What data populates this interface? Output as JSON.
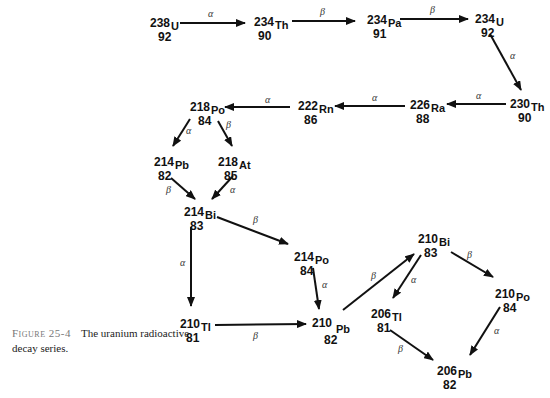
{
  "caption": {
    "figure_label": "Figure 25-4",
    "text": "The uranium radioactive decay series."
  },
  "nuclides": [
    {
      "id": "U238",
      "mass": "238",
      "symbol": "U",
      "z": "92"
    },
    {
      "id": "Th234",
      "mass": "234",
      "symbol": "Th",
      "z": "90"
    },
    {
      "id": "Pa234",
      "mass": "234",
      "symbol": "Pa",
      "z": "91"
    },
    {
      "id": "U234",
      "mass": "234",
      "symbol": "U",
      "z": "92"
    },
    {
      "id": "Th230",
      "mass": "230",
      "symbol": "Th",
      "z": "90"
    },
    {
      "id": "Ra226",
      "mass": "226",
      "symbol": "Ra",
      "z": "88"
    },
    {
      "id": "Rn222",
      "mass": "222",
      "symbol": "Rn",
      "z": "86"
    },
    {
      "id": "Po218",
      "mass": "218",
      "symbol": "Po",
      "z": "84"
    },
    {
      "id": "Pb214",
      "mass": "214",
      "symbol": "Pb",
      "z": "82"
    },
    {
      "id": "At218",
      "mass": "218",
      "symbol": "At",
      "z": "85"
    },
    {
      "id": "Bi214",
      "mass": "214",
      "symbol": "Bi",
      "z": "83"
    },
    {
      "id": "Po214",
      "mass": "214",
      "symbol": "Po",
      "z": "84"
    },
    {
      "id": "Tl210",
      "mass": "210",
      "symbol": "Tl",
      "z": "81"
    },
    {
      "id": "Pb210",
      "mass": "210",
      "symbol": "Pb",
      "z": "82"
    },
    {
      "id": "Bi210",
      "mass": "210",
      "symbol": "Bi",
      "z": "83"
    },
    {
      "id": "Tl206",
      "mass": "206",
      "symbol": "Tl",
      "z": "81"
    },
    {
      "id": "Po210",
      "mass": "210",
      "symbol": "Po",
      "z": "84"
    },
    {
      "id": "Pb206",
      "mass": "206",
      "symbol": "Pb",
      "z": "82"
    }
  ],
  "decays": [
    {
      "from": "U238",
      "to": "Th234",
      "type": "α"
    },
    {
      "from": "Th234",
      "to": "Pa234",
      "type": "β"
    },
    {
      "from": "Pa234",
      "to": "U234",
      "type": "β"
    },
    {
      "from": "U234",
      "to": "Th230",
      "type": "α"
    },
    {
      "from": "Th230",
      "to": "Ra226",
      "type": "α"
    },
    {
      "from": "Ra226",
      "to": "Rn222",
      "type": "α"
    },
    {
      "from": "Rn222",
      "to": "Po218",
      "type": "α"
    },
    {
      "from": "Po218",
      "to": "Pb214",
      "type": "α"
    },
    {
      "from": "Po218",
      "to": "At218",
      "type": "β"
    },
    {
      "from": "Pb214",
      "to": "Bi214",
      "type": "β"
    },
    {
      "from": "At218",
      "to": "Bi214",
      "type": "α"
    },
    {
      "from": "Bi214",
      "to": "Po214",
      "type": "β"
    },
    {
      "from": "Bi214",
      "to": "Tl210",
      "type": "α"
    },
    {
      "from": "Po214",
      "to": "Pb210",
      "type": "α"
    },
    {
      "from": "Tl210",
      "to": "Pb210",
      "type": "β"
    },
    {
      "from": "Pb210",
      "to": "Bi210",
      "type": "β"
    },
    {
      "from": "Bi210",
      "to": "Tl206",
      "type": "α"
    },
    {
      "from": "Bi210",
      "to": "Po210",
      "type": "β"
    },
    {
      "from": "Tl206",
      "to": "Pb206",
      "type": "β"
    },
    {
      "from": "Po210",
      "to": "Pb206",
      "type": "α"
    }
  ]
}
